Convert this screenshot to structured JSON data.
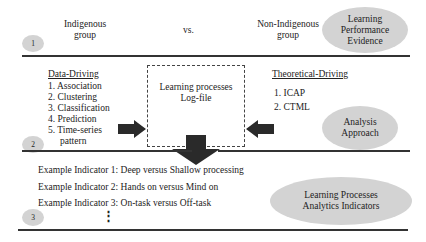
{
  "section1": {
    "number": "1",
    "left_group": "Indigenous group",
    "left_group_lines": [
      "Indigenous",
      "group"
    ],
    "vs": "vs.",
    "right_group_lines": [
      "Non-Indigenous",
      "group"
    ],
    "ellipse_lines": [
      "Learning",
      "Performance",
      "Evidence"
    ]
  },
  "section2": {
    "number": "2",
    "data_driving": {
      "title": "Data-Driving",
      "items": [
        "1. Association",
        "2. Clustering",
        "3. Classification",
        "4. Prediction",
        "5. Time-series",
        "pattern"
      ]
    },
    "center_box_lines": [
      "Learning processes",
      "Log-file"
    ],
    "theoretical_driving": {
      "title": "Theoretical-Driving",
      "items": [
        "1. ICAP",
        "2. CTML"
      ]
    },
    "ellipse_lines": [
      "Analysis",
      "Approach"
    ]
  },
  "section3": {
    "number": "3",
    "indicators": [
      "Example Indicator 1: Deep versus Shallow processing",
      "Example Indicator 2: Hands on versus Mind on",
      "Example Indicator 3: On-task versus Off-task"
    ],
    "ellipsis": "⋮",
    "ellipse_lines": [
      "Learning Processes",
      "Analytics Indicators"
    ]
  },
  "colors": {
    "ellipse_fill": "#d3d3d3",
    "arrow_fill": "#2a2a2a",
    "rule": "#333333"
  }
}
